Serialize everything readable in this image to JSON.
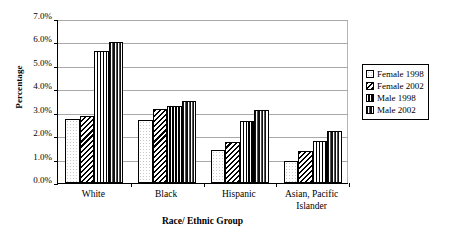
{
  "chart_data": {
    "type": "bar",
    "title": "",
    "xlabel": "Race/ Ethnic Group",
    "ylabel": "Percentage",
    "categories": [
      "White",
      "Black",
      "Hispanic",
      "Asian, Pacific Islander"
    ],
    "category_lines": [
      [
        "White"
      ],
      [
        "Black"
      ],
      [
        "Hispanic"
      ],
      [
        "Asian, Pacific",
        "Islander"
      ]
    ],
    "series": [
      {
        "name": "Female 1998",
        "pattern": "empty-dotted",
        "values": [
          2.75,
          2.7,
          1.4,
          0.95
        ]
      },
      {
        "name": "Female 2002",
        "pattern": "diagonal-hatch",
        "values": [
          2.85,
          3.15,
          1.75,
          1.35
        ]
      },
      {
        "name": "Male 1998",
        "pattern": "checkerboard",
        "values": [
          5.65,
          3.3,
          2.65,
          1.8
        ]
      },
      {
        "name": "Male 2002",
        "pattern": "vertical-stripes",
        "values": [
          6.0,
          3.5,
          3.1,
          2.2
        ]
      }
    ],
    "ylim": [
      0.0,
      7.0
    ],
    "ytick_step": 1.0,
    "yticks": [
      0.0,
      1.0,
      2.0,
      3.0,
      4.0,
      5.0,
      6.0,
      7.0
    ],
    "ytick_labels": [
      "0.0%",
      "1.0%",
      "2.0%",
      "3.0%",
      "4.0%",
      "5.0%",
      "6.0%",
      "7.0%"
    ],
    "grid": true,
    "grid_axis": "y",
    "legend_position": "right",
    "legend_entries": [
      "Female 1998",
      "Female 2002",
      "Male 1998",
      "Male 2002"
    ],
    "colors": {
      "axis": "#000000",
      "grid": "#a9a9a9",
      "background": "#ffffff",
      "text": "#000000"
    }
  }
}
